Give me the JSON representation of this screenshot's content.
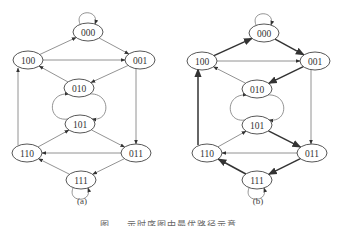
{
  "figure": {
    "caption": "图 … 示时序图中最优路径示意",
    "panels": [
      {
        "label": "(a)",
        "nodes": [
          {
            "id": "000",
            "x": 88,
            "y": 32
          },
          {
            "id": "100",
            "x": 28,
            "y": 60
          },
          {
            "id": "001",
            "x": 140,
            "y": 60
          },
          {
            "id": "010",
            "x": 79,
            "y": 88
          },
          {
            "id": "101",
            "x": 80,
            "y": 124
          },
          {
            "id": "110",
            "x": 27,
            "y": 153
          },
          {
            "id": "011",
            "x": 136,
            "y": 153
          },
          {
            "id": "111",
            "x": 81,
            "y": 180
          }
        ],
        "edges": [
          {
            "from": "000",
            "to": "000",
            "type": "self-loop",
            "bold": false
          },
          {
            "from": "100",
            "to": "000",
            "bold": false
          },
          {
            "from": "000",
            "to": "001",
            "bold": false
          },
          {
            "from": "100",
            "to": "001",
            "bold": false
          },
          {
            "from": "010",
            "to": "100",
            "bold": false
          },
          {
            "from": "001",
            "to": "010",
            "bold": false
          },
          {
            "from": "010",
            "to": "101",
            "type": "curve-left",
            "bold": false
          },
          {
            "from": "101",
            "to": "010",
            "type": "curve-right",
            "bold": false
          },
          {
            "from": "001",
            "to": "011",
            "bold": false
          },
          {
            "from": "110",
            "to": "100",
            "bold": false
          },
          {
            "from": "110",
            "to": "101",
            "bold": false
          },
          {
            "from": "101",
            "to": "011",
            "bold": false
          },
          {
            "from": "011",
            "to": "110",
            "bold": false
          },
          {
            "from": "011",
            "to": "111",
            "bold": false
          },
          {
            "from": "111",
            "to": "110",
            "bold": false
          },
          {
            "from": "111",
            "to": "111",
            "type": "self-loop",
            "bold": false
          }
        ]
      },
      {
        "label": "(b)",
        "nodes": [
          {
            "id": "000",
            "x": 264,
            "y": 33
          },
          {
            "id": "100",
            "x": 202,
            "y": 61
          },
          {
            "id": "001",
            "x": 315,
            "y": 61
          },
          {
            "id": "010",
            "x": 257,
            "y": 89
          },
          {
            "id": "101",
            "x": 257,
            "y": 125
          },
          {
            "id": "110",
            "x": 207,
            "y": 153
          },
          {
            "id": "011",
            "x": 312,
            "y": 153
          },
          {
            "id": "111",
            "x": 257,
            "y": 180
          }
        ],
        "edges": [
          {
            "from": "000",
            "to": "000",
            "type": "self-loop",
            "bold": false
          },
          {
            "from": "100",
            "to": "000",
            "bold": true
          },
          {
            "from": "000",
            "to": "001",
            "bold": true
          },
          {
            "from": "100",
            "to": "001",
            "bold": false
          },
          {
            "from": "010",
            "to": "100",
            "bold": false
          },
          {
            "from": "001",
            "to": "010",
            "bold": true
          },
          {
            "from": "010",
            "to": "101",
            "type": "curve-left",
            "bold": false
          },
          {
            "from": "101",
            "to": "010",
            "type": "curve-right",
            "bold": false
          },
          {
            "from": "001",
            "to": "011",
            "bold": false
          },
          {
            "from": "110",
            "to": "100",
            "bold": true
          },
          {
            "from": "110",
            "to": "101",
            "bold": false
          },
          {
            "from": "101",
            "to": "011",
            "bold": true
          },
          {
            "from": "011",
            "to": "110",
            "bold": false
          },
          {
            "from": "011",
            "to": "111",
            "bold": true
          },
          {
            "from": "111",
            "to": "110",
            "bold": true
          },
          {
            "from": "111",
            "to": "111",
            "type": "self-loop",
            "bold": false
          }
        ]
      }
    ]
  }
}
